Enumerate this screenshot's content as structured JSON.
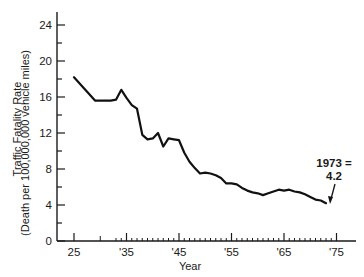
{
  "chart_data": {
    "type": "line",
    "title": "",
    "xlabel": "Year",
    "ylabel": "Traffic Fatality Rate",
    "ylabel_sub": "(Death per 100,000,000 vehicle miles)",
    "xlim": [
      1922,
      1977
    ],
    "ylim": [
      0,
      25
    ],
    "grid": false,
    "legend": null,
    "x_ticks": [
      {
        "value": 1925,
        "label": "25"
      },
      {
        "value": 1935,
        "label": "'35"
      },
      {
        "value": 1945,
        "label": "'45"
      },
      {
        "value": 1955,
        "label": "'55"
      },
      {
        "value": 1965,
        "label": "'65"
      },
      {
        "value": 1975,
        "label": "'75"
      }
    ],
    "y_ticks": [
      0,
      4,
      8,
      12,
      16,
      20,
      24
    ],
    "series": [
      {
        "name": "Traffic Fatality Rate",
        "x": [
          1925,
          1929,
          1932,
          1933,
          1934,
          1935,
          1936,
          1937,
          1938,
          1939,
          1940,
          1941,
          1942,
          1943,
          1944,
          1945,
          1946,
          1947,
          1948,
          1949,
          1950,
          1951,
          1952,
          1953,
          1954,
          1955,
          1956,
          1957,
          1958,
          1959,
          1960,
          1961,
          1962,
          1963,
          1964,
          1965,
          1966,
          1967,
          1968,
          1969,
          1970,
          1971,
          1972,
          1973
        ],
        "values": [
          18.2,
          15.6,
          15.6,
          15.7,
          16.8,
          15.9,
          15.1,
          14.7,
          11.8,
          11.3,
          11.4,
          12.0,
          10.5,
          11.4,
          11.3,
          11.2,
          9.8,
          8.8,
          8.1,
          7.5,
          7.6,
          7.5,
          7.3,
          7.0,
          6.4,
          6.4,
          6.3,
          5.9,
          5.6,
          5.4,
          5.3,
          5.1,
          5.3,
          5.5,
          5.7,
          5.6,
          5.7,
          5.5,
          5.4,
          5.2,
          4.9,
          4.6,
          4.5,
          4.2
        ]
      }
    ],
    "annotations": [
      {
        "text_line1": "1973 =",
        "text_line2": "4.2",
        "x": 1973,
        "y": 4.2,
        "arrow": true
      }
    ]
  }
}
